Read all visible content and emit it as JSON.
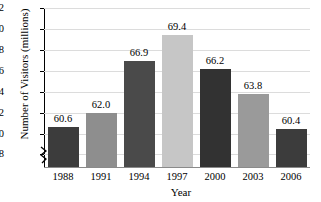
{
  "chart_data": {
    "type": "bar",
    "title": "",
    "xlabel": "Year",
    "ylabel": "Number of Visitors (millions)",
    "categories": [
      "1988",
      "1991",
      "1994",
      "1997",
      "2000",
      "2003",
      "2006"
    ],
    "values": [
      60.6,
      62.0,
      66.9,
      69.4,
      66.2,
      63.8,
      60.4
    ],
    "value_labels": [
      "60.6",
      "62.0",
      "66.9",
      "69.4",
      "66.2",
      "63.8",
      "60.4"
    ],
    "bar_colors": [
      "#3c3c3c",
      "#8e8e8e",
      "#4a4a4a",
      "#c6c6c6",
      "#323232",
      "#9a9a9a",
      "#3c3c3c"
    ],
    "ylim": [
      56.8,
      72
    ],
    "yticks": [
      58,
      60,
      62,
      64,
      66,
      68,
      70,
      72
    ],
    "ytick_labels": [
      "58",
      "60",
      "62",
      "64",
      "66",
      "68",
      "70",
      "72"
    ],
    "grid": true,
    "grid_color": "#dcdcdc",
    "axis_break": true,
    "legend": null,
    "legend_position": "none"
  }
}
